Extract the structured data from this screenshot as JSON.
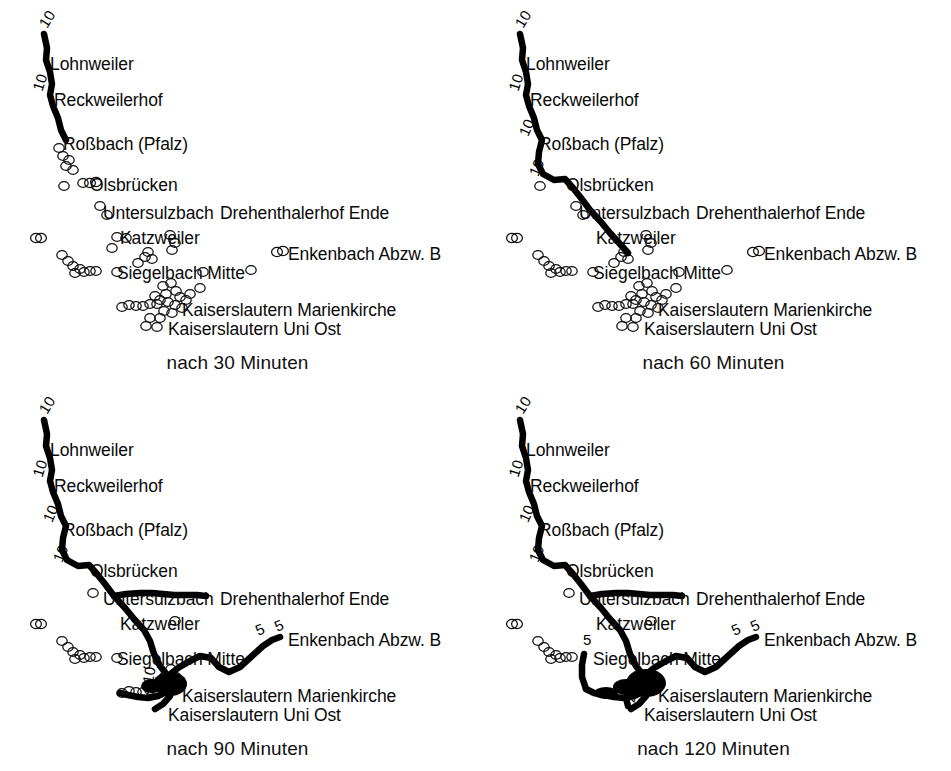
{
  "figure": {
    "background": "#ffffff",
    "ink": "#000000"
  },
  "panels": [
    {
      "id": "p30",
      "caption": "nach 30 Minuten",
      "minutes": 30,
      "stop_labels": [
        {
          "text": "Lohnweiler",
          "x": 50,
          "y": 56
        },
        {
          "text": "Reckweilerhof",
          "x": 54,
          "y": 92
        },
        {
          "text": "Roßbach (Pfalz)",
          "x": 63,
          "y": 136
        },
        {
          "text": "Olsbrücken",
          "x": 90,
          "y": 177
        },
        {
          "text": "Untersulzbach",
          "x": 103,
          "y": 205
        },
        {
          "text": "Drehenthalerhof Ende",
          "x": 220,
          "y": 205
        },
        {
          "text": "Katzweiler",
          "x": 120,
          "y": 230
        },
        {
          "text": "Enkenbach Abzw. B",
          "x": 288,
          "y": 246
        },
        {
          "text": "Siegelbach Mitte",
          "x": 117,
          "y": 265
        },
        {
          "text": "Kaiserslautern Marienkirche",
          "x": 182,
          "y": 302
        },
        {
          "text": "Kaiserslautern Uni Ost",
          "x": 168,
          "y": 321
        }
      ],
      "route_numbers": [
        {
          "text": "10",
          "x": 36,
          "y": 22,
          "rot": "r-a"
        },
        {
          "text": "10",
          "x": 30,
          "y": 88,
          "rot": "r-b"
        }
      ]
    },
    {
      "id": "p60",
      "caption": "nach 60 Minuten",
      "minutes": 60,
      "stop_labels": [
        {
          "text": "Lohnweiler",
          "x": 50,
          "y": 56
        },
        {
          "text": "Reckweilerhof",
          "x": 54,
          "y": 92
        },
        {
          "text": "Roßbach (Pfalz)",
          "x": 63,
          "y": 136
        },
        {
          "text": "Olsbrücken",
          "x": 90,
          "y": 177
        },
        {
          "text": "Untersulzbach",
          "x": 103,
          "y": 205
        },
        {
          "text": "Drehenthalerhof Ende",
          "x": 220,
          "y": 205
        },
        {
          "text": "Katzweiler",
          "x": 120,
          "y": 230
        },
        {
          "text": "Enkenbach Abzw. B",
          "x": 288,
          "y": 246
        },
        {
          "text": "Siegelbach Mitte",
          "x": 117,
          "y": 265
        },
        {
          "text": "Kaiserslautern Marienkirche",
          "x": 182,
          "y": 302
        },
        {
          "text": "Kaiserslautern Uni Ost",
          "x": 168,
          "y": 321
        }
      ],
      "route_numbers": [
        {
          "text": "10",
          "x": 36,
          "y": 22,
          "rot": "r-a"
        },
        {
          "text": "10",
          "x": 30,
          "y": 88,
          "rot": "r-b"
        },
        {
          "text": "10",
          "x": 40,
          "y": 132,
          "rot": "r-c"
        },
        {
          "text": "10",
          "x": 50,
          "y": 172,
          "rot": "r-c"
        }
      ]
    },
    {
      "id": "p90",
      "caption": "nach 90 Minuten",
      "minutes": 90,
      "stop_labels": [
        {
          "text": "Lohnweiler",
          "x": 50,
          "y": 56
        },
        {
          "text": "Reckweilerhof",
          "x": 54,
          "y": 92
        },
        {
          "text": "Roßbach (Pfalz)",
          "x": 63,
          "y": 136
        },
        {
          "text": "Olsbrücken",
          "x": 90,
          "y": 177
        },
        {
          "text": "Untersulzbach",
          "x": 103,
          "y": 205
        },
        {
          "text": "Drehenthalerhof Ende",
          "x": 220,
          "y": 205
        },
        {
          "text": "Katzweiler",
          "x": 120,
          "y": 230
        },
        {
          "text": "Enkenbach Abzw. B",
          "x": 288,
          "y": 246
        },
        {
          "text": "Siegelbach Mitte",
          "x": 117,
          "y": 265
        },
        {
          "text": "Kaiserslautern Marienkirche",
          "x": 182,
          "y": 302
        },
        {
          "text": "Kaiserslautern Uni Ost",
          "x": 168,
          "y": 321
        }
      ],
      "route_numbers": [
        {
          "text": "10",
          "x": 36,
          "y": 22,
          "rot": "r-a"
        },
        {
          "text": "10",
          "x": 30,
          "y": 88,
          "rot": "r-b"
        },
        {
          "text": "10",
          "x": 40,
          "y": 132,
          "rot": "r-c"
        },
        {
          "text": "10",
          "x": 50,
          "y": 172,
          "rot": "r-c"
        },
        {
          "text": "10",
          "x": 140,
          "y": 296,
          "rot": "r-f"
        },
        {
          "text": "5",
          "x": 253,
          "y": 238,
          "rot": "r-d"
        },
        {
          "text": "5",
          "x": 272,
          "y": 234,
          "rot": "r-d"
        }
      ]
    },
    {
      "id": "p120",
      "caption": "nach 120 Minuten",
      "minutes": 120,
      "stop_labels": [
        {
          "text": "Lohnweiler",
          "x": 50,
          "y": 56
        },
        {
          "text": "Reckweilerhof",
          "x": 54,
          "y": 92
        },
        {
          "text": "Roßbach (Pfalz)",
          "x": 63,
          "y": 136
        },
        {
          "text": "Olsbrücken",
          "x": 90,
          "y": 177
        },
        {
          "text": "Untersulzbach",
          "x": 103,
          "y": 205
        },
        {
          "text": "Drehenthalerhof Ende",
          "x": 220,
          "y": 205
        },
        {
          "text": "Katzweiler",
          "x": 120,
          "y": 230
        },
        {
          "text": "Enkenbach Abzw. B",
          "x": 288,
          "y": 246
        },
        {
          "text": "Siegelbach Mitte",
          "x": 117,
          "y": 265
        },
        {
          "text": "Kaiserslautern Marienkirche",
          "x": 182,
          "y": 302
        },
        {
          "text": "Kaiserslautern Uni Ost",
          "x": 168,
          "y": 321
        }
      ],
      "route_numbers": [
        {
          "text": "10",
          "x": 36,
          "y": 22,
          "rot": "r-a"
        },
        {
          "text": "10",
          "x": 30,
          "y": 88,
          "rot": "r-b"
        },
        {
          "text": "10",
          "x": 40,
          "y": 132,
          "rot": "r-c"
        },
        {
          "text": "10",
          "x": 50,
          "y": 172,
          "rot": "r-c"
        },
        {
          "text": "5",
          "x": 107,
          "y": 246,
          "rot": "r-g"
        },
        {
          "text": "4",
          "x": 148,
          "y": 315,
          "rot": "r-f"
        },
        {
          "text": "5",
          "x": 253,
          "y": 238,
          "rot": "r-d"
        },
        {
          "text": "5",
          "x": 272,
          "y": 234,
          "rot": "r-d"
        }
      ]
    }
  ],
  "chart_data": {
    "type": "scatter",
    "subtitle": "Vier Zeitschnitte: 30, 60, 90 und 120 Minuten",
    "xlabel": "",
    "ylabel": "",
    "grid": false,
    "legend_position": "none",
    "panel_layout": "2x2",
    "panel_captions": [
      "nach 30 Minuten",
      "nach 60 Minuten",
      "nach 90 Minuten",
      "nach 120 Minuten"
    ],
    "marker_types": [
      {
        "name": "reached",
        "style": "thick black line / filled",
        "meaning": "im Zeitfenster erreichbar"
      },
      {
        "name": "not-reached",
        "style": "small open circle",
        "meaning": "nicht erreichbar"
      }
    ],
    "named_stops": [
      "Lohnweiler",
      "Reckweilerhof",
      "Roßbach (Pfalz)",
      "Olsbrücken",
      "Untersulzbach",
      "Drehenthalerhof Ende",
      "Katzweiler",
      "Enkenbach Abzw. B",
      "Siegelbach Mitte",
      "Kaiserslautern Marienkirche",
      "Kaiserslautern Uni Ost"
    ],
    "route_numbers_used": [
      "10",
      "5",
      "4"
    ],
    "series": [
      {
        "name": "nach 30 Minuten",
        "reached_corridor": [
          "10"
        ],
        "reached_stops": [
          "Lohnweiler",
          "Reckweilerhof",
          "Roßbach (Pfalz)"
        ]
      },
      {
        "name": "nach 60 Minuten",
        "reached_corridor": [
          "10"
        ],
        "reached_stops": [
          "Lohnweiler",
          "Reckweilerhof",
          "Roßbach (Pfalz)",
          "Olsbrücken",
          "Untersulzbach",
          "Katzweiler"
        ]
      },
      {
        "name": "nach 90 Minuten",
        "reached_corridor": [
          "10",
          "5"
        ],
        "reached_stops": [
          "Lohnweiler",
          "Reckweilerhof",
          "Roßbach (Pfalz)",
          "Olsbrücken",
          "Untersulzbach",
          "Drehenthalerhof Ende",
          "Katzweiler",
          "Siegelbach Mitte",
          "Kaiserslautern Marienkirche",
          "Kaiserslautern Uni Ost",
          "Enkenbach Abzw. B"
        ]
      },
      {
        "name": "nach 120 Minuten",
        "reached_corridor": [
          "10",
          "5",
          "4"
        ],
        "reached_stops": [
          "Lohnweiler",
          "Reckweilerhof",
          "Roßbach (Pfalz)",
          "Olsbrücken",
          "Untersulzbach",
          "Drehenthalerhof Ende",
          "Katzweiler",
          "Siegelbach Mitte",
          "Kaiserslautern Marienkirche",
          "Kaiserslautern Uni Ost",
          "Enkenbach Abzw. B"
        ]
      }
    ]
  }
}
